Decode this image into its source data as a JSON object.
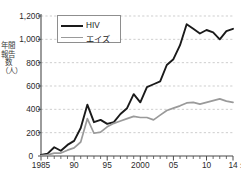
{
  "chart_data": {
    "type": "line",
    "title": "",
    "xlabel": "",
    "ylabel": "年間報告数（人）",
    "x_unit_suffix": "年",
    "ylim": [
      0,
      1200
    ],
    "xlim": [
      1985,
      2014
    ],
    "grid": true,
    "gridlines_y": [
      0,
      200,
      400,
      600,
      800,
      1000,
      1200
    ],
    "legend_position": "top-left-inside",
    "y_ticks": [
      {
        "value": 1200,
        "label": "1,200"
      },
      {
        "value": 1000,
        "label": "1,000"
      },
      {
        "value": 800,
        "label": "800"
      },
      {
        "value": 600,
        "label": "600"
      },
      {
        "value": 400,
        "label": "400"
      },
      {
        "value": 200,
        "label": "200"
      },
      {
        "value": 0,
        "label": "0"
      }
    ],
    "x_ticks": [
      {
        "value": 1985,
        "label": "1985"
      },
      {
        "value": 1990,
        "label": "90"
      },
      {
        "value": 1995,
        "label": "95"
      },
      {
        "value": 2000,
        "label": "2000"
      },
      {
        "value": 2005,
        "label": "05"
      },
      {
        "value": 2010,
        "label": "10"
      },
      {
        "value": 2014,
        "label": "14"
      }
    ],
    "x": [
      1985,
      1986,
      1987,
      1988,
      1989,
      1990,
      1991,
      1992,
      1993,
      1994,
      1995,
      1996,
      1997,
      1998,
      1999,
      2000,
      2001,
      2002,
      2003,
      2004,
      2005,
      2006,
      2007,
      2008,
      2009,
      2010,
      2011,
      2012,
      2013,
      2014
    ],
    "series": [
      {
        "name": "HIV",
        "color": "#1a1a1a",
        "values": [
          10,
          20,
          75,
          45,
          95,
          130,
          240,
          440,
          290,
          310,
          275,
          290,
          360,
          410,
          530,
          460,
          590,
          615,
          640,
          780,
          830,
          950,
          1130,
          1090,
          1050,
          1080,
          1060,
          1000,
          1070,
          1090
        ]
      },
      {
        "name": "エイズ",
        "color": "#9a9a9a",
        "values": [
          4,
          10,
          25,
          25,
          50,
          70,
          120,
          320,
          195,
          205,
          250,
          280,
          300,
          320,
          340,
          330,
          330,
          310,
          350,
          390,
          410,
          430,
          455,
          460,
          445,
          460,
          475,
          490,
          470,
          460
        ]
      }
    ]
  },
  "legend": {
    "items": [
      {
        "label": "HIV",
        "color": "#1a1a1a"
      },
      {
        "label": "エイズ",
        "color": "#9a9a9a"
      }
    ]
  },
  "axes": {
    "y_title": "年間報告数（人）",
    "origin_label": "0",
    "x_unit": "年"
  }
}
